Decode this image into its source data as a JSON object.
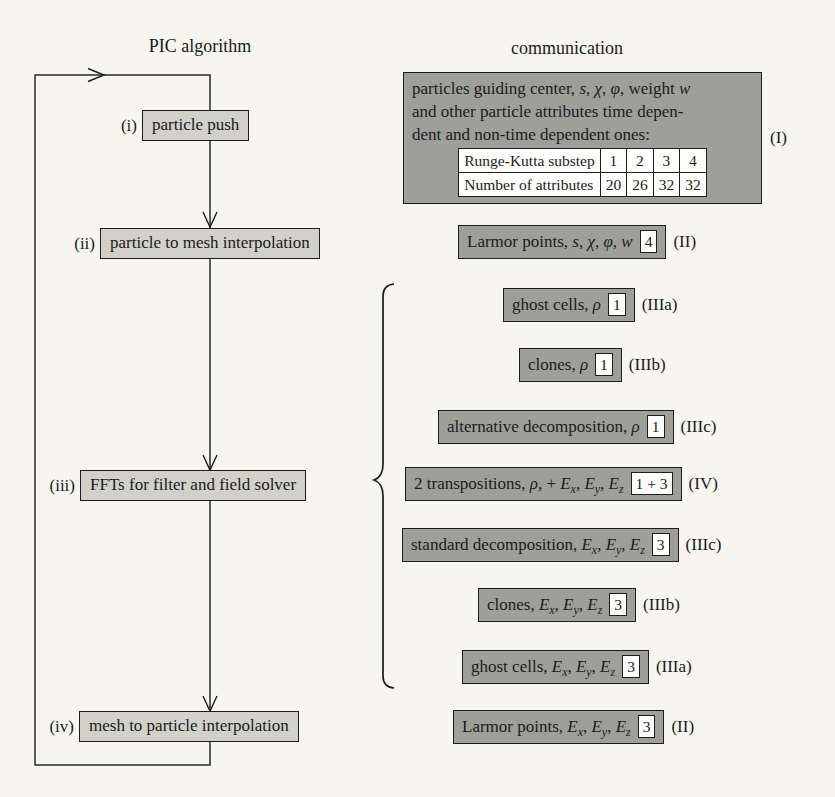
{
  "headers": {
    "left": "PIC algorithm",
    "right": "communication"
  },
  "colors": {
    "background": "#f6f5f0",
    "algorithm_box_fill": "#d1d1ca",
    "communication_box_fill": "#9f9f99",
    "border": "#1d1d1d",
    "badge_fill": "#fdfdfb",
    "text": "#1b1b1b"
  },
  "algorithm": {
    "steps": [
      {
        "label": "(i)",
        "text": "particle push"
      },
      {
        "label": "(ii)",
        "text": "particle to mesh interpolation"
      },
      {
        "label": "(iii)",
        "text": "FFTs for filter and field solver"
      },
      {
        "label": "(iv)",
        "text": "mesh to particle interpolation"
      }
    ]
  },
  "info_box": {
    "label": "(I)",
    "lines": [
      [
        {
          "t": "particles guiding center, "
        },
        {
          "t": "s",
          "m": 1
        },
        {
          "t": ", "
        },
        {
          "t": "χ",
          "m": 1
        },
        {
          "t": ", "
        },
        {
          "t": "φ",
          "m": 1
        },
        {
          "t": ", weight "
        },
        {
          "t": "w",
          "m": 1
        }
      ],
      [
        {
          "t": "and other particle attributes time depen-"
        }
      ],
      [
        {
          "t": "dent and non-time dependent ones:"
        }
      ]
    ],
    "table": {
      "rows": [
        [
          "Runge-Kutta substep",
          "1",
          "2",
          "3",
          "4"
        ],
        [
          "Number of attributes",
          "20",
          "26",
          "32",
          "32"
        ]
      ]
    }
  },
  "comm_rows": [
    {
      "segments": [
        {
          "t": "Larmor points, "
        },
        {
          "t": "s",
          "m": 1
        },
        {
          "t": ", "
        },
        {
          "t": "χ",
          "m": 1
        },
        {
          "t": ", "
        },
        {
          "t": "φ",
          "m": 1
        },
        {
          "t": ", "
        },
        {
          "t": "w",
          "m": 1
        }
      ],
      "badge": "4",
      "label": "(II)"
    },
    {
      "segments": [
        {
          "t": "ghost cells, "
        },
        {
          "t": "ρ",
          "m": 1
        }
      ],
      "badge": "1",
      "label": "(IIIa)"
    },
    {
      "segments": [
        {
          "t": "clones, "
        },
        {
          "t": "ρ",
          "m": 1
        }
      ],
      "badge": "1",
      "label": "(IIIb)"
    },
    {
      "segments": [
        {
          "t": "alternative decomposition, "
        },
        {
          "t": "ρ",
          "m": 1
        }
      ],
      "badge": "1",
      "label": "(IIIc)"
    },
    {
      "segments": [
        {
          "t": "2 transpositions, "
        },
        {
          "t": "ρ",
          "m": 1
        },
        {
          "t": ", + "
        },
        {
          "t": "E",
          "m": 1
        },
        {
          "t": "x",
          "m": 1,
          "sub": 1
        },
        {
          "t": ", "
        },
        {
          "t": "E",
          "m": 1
        },
        {
          "t": "y",
          "m": 1,
          "sub": 1
        },
        {
          "t": ", "
        },
        {
          "t": "E",
          "m": 1
        },
        {
          "t": "z",
          "m": 1,
          "sub": 1
        }
      ],
      "badge": "1 + 3",
      "label": "(IV)"
    },
    {
      "segments": [
        {
          "t": "standard decomposition, "
        },
        {
          "t": "E",
          "m": 1
        },
        {
          "t": "x",
          "m": 1,
          "sub": 1
        },
        {
          "t": ", "
        },
        {
          "t": "E",
          "m": 1
        },
        {
          "t": "y",
          "m": 1,
          "sub": 1
        },
        {
          "t": ", "
        },
        {
          "t": "E",
          "m": 1
        },
        {
          "t": "z",
          "m": 1,
          "sub": 1
        }
      ],
      "badge": "3",
      "label": "(IIIc)"
    },
    {
      "segments": [
        {
          "t": "clones, "
        },
        {
          "t": "E",
          "m": 1
        },
        {
          "t": "x",
          "m": 1,
          "sub": 1
        },
        {
          "t": ", "
        },
        {
          "t": "E",
          "m": 1
        },
        {
          "t": "y",
          "m": 1,
          "sub": 1
        },
        {
          "t": ", "
        },
        {
          "t": "E",
          "m": 1
        },
        {
          "t": "z",
          "m": 1,
          "sub": 1
        }
      ],
      "badge": "3",
      "label": "(IIIb)"
    },
    {
      "segments": [
        {
          "t": "ghost cells, "
        },
        {
          "t": "E",
          "m": 1
        },
        {
          "t": "x",
          "m": 1,
          "sub": 1
        },
        {
          "t": ", "
        },
        {
          "t": "E",
          "m": 1
        },
        {
          "t": "y",
          "m": 1,
          "sub": 1
        },
        {
          "t": ", "
        },
        {
          "t": "E",
          "m": 1
        },
        {
          "t": "z",
          "m": 1,
          "sub": 1
        }
      ],
      "badge": "3",
      "label": "(IIIa)"
    },
    {
      "segments": [
        {
          "t": "Larmor points, "
        },
        {
          "t": "E",
          "m": 1
        },
        {
          "t": "x",
          "m": 1,
          "sub": 1
        },
        {
          "t": ", "
        },
        {
          "t": "E",
          "m": 1
        },
        {
          "t": "y",
          "m": 1,
          "sub": 1
        },
        {
          "t": ", "
        },
        {
          "t": "E",
          "m": 1
        },
        {
          "t": "z",
          "m": 1,
          "sub": 1
        }
      ],
      "badge": "3",
      "label": "(II)"
    }
  ]
}
